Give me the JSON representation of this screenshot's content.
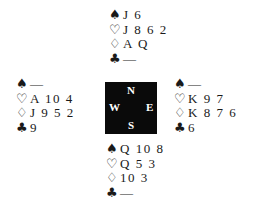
{
  "suits": {
    "spade": "♠",
    "heart": "♡",
    "diamond": "♢",
    "club": "♣"
  },
  "hands": {
    "north": {
      "spades": "J 6",
      "hearts": "J 8 6 2",
      "diamonds": "A Q",
      "clubs": "—"
    },
    "west": {
      "spades": "—",
      "hearts": "A 10 4",
      "diamonds": "J 9 5 2",
      "clubs": "9"
    },
    "east": {
      "spades": "—",
      "hearts": "K 9 7",
      "diamonds": "K 8 7 6",
      "clubs": "6"
    },
    "south": {
      "spades": "Q 10 8",
      "hearts": "Q 5 3",
      "diamonds": "10 3",
      "clubs": "—"
    }
  },
  "compass": {
    "north": "N",
    "south": "S",
    "west": "W",
    "east": "E",
    "background": "#0a0a0a",
    "text_color": "#ffffff"
  }
}
